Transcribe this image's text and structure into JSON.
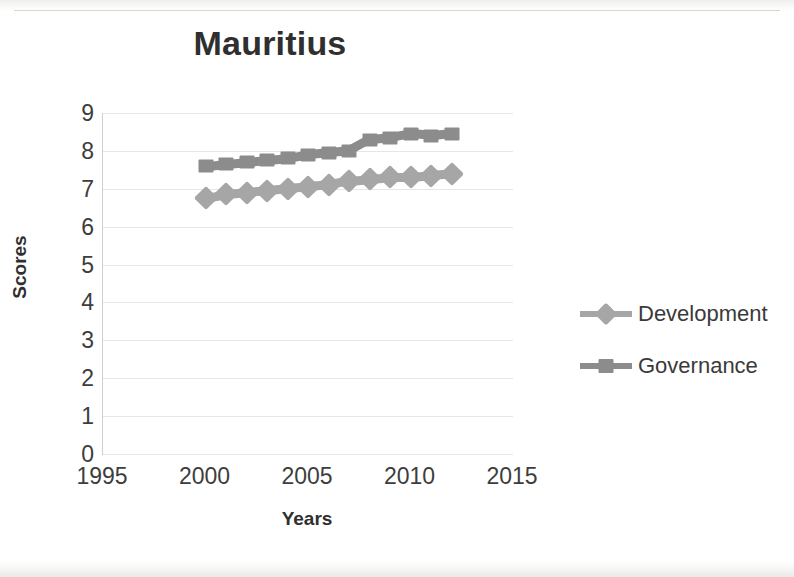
{
  "chart_data": {
    "type": "line",
    "title": "Mauritius",
    "xlabel": "Years",
    "ylabel": "Scores",
    "x": [
      2000,
      2001,
      2002,
      2003,
      2004,
      2005,
      2006,
      2007,
      2008,
      2009,
      2010,
      2011,
      2012
    ],
    "xlim": [
      1995,
      2015
    ],
    "ylim": [
      0,
      9
    ],
    "xticks": [
      1995,
      2000,
      2005,
      2010,
      2015
    ],
    "yticks": [
      0,
      1,
      2,
      3,
      4,
      5,
      6,
      7,
      8,
      9
    ],
    "grid": true,
    "legend_position": "right",
    "series": [
      {
        "name": "Development",
        "marker": "diamond",
        "color": "#a6a6a6",
        "values": [
          6.75,
          6.85,
          6.9,
          6.95,
          7.0,
          7.05,
          7.1,
          7.2,
          7.25,
          7.3,
          7.3,
          7.35,
          7.4
        ]
      },
      {
        "name": "Governance",
        "marker": "square",
        "color": "#8c8c8c",
        "values": [
          7.6,
          7.65,
          7.7,
          7.75,
          7.8,
          7.9,
          7.95,
          8.0,
          8.3,
          8.35,
          8.45,
          8.4,
          8.45
        ]
      }
    ]
  },
  "colors": {
    "development": "#a6a6a6",
    "governance": "#8c8c8c",
    "gridline": "#e6e6e6",
    "axis": "#b9b9b9",
    "text": "#3a3a3a"
  }
}
